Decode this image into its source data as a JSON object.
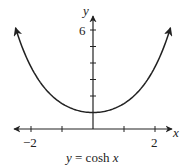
{
  "chart_data": {
    "type": "line",
    "title": "y = cosh x",
    "xlabel": "x",
    "ylabel": "y",
    "function": "cosh(x)",
    "xlim": [
      -2.5,
      2.5
    ],
    "ylim": [
      0,
      6.5
    ],
    "x_tick_labels": [
      {
        "value": -2,
        "label": "−2"
      },
      {
        "value": 2,
        "label": "2"
      }
    ],
    "x_ticks": [
      -2,
      -1,
      0,
      1,
      2
    ],
    "y_tick_labels": [
      {
        "value": 6,
        "label": "6"
      }
    ],
    "y_ticks": [
      1,
      2,
      3,
      4,
      5,
      6
    ],
    "grid": false,
    "legend": null,
    "series": [
      {
        "name": "y = cosh x",
        "x": [
          -2.5,
          -2,
          -1.5,
          -1,
          -0.5,
          0,
          0.5,
          1,
          1.5,
          2,
          2.5
        ],
        "y": [
          6.13,
          3.76,
          2.35,
          1.54,
          1.13,
          1.0,
          1.13,
          1.54,
          2.35,
          3.76,
          6.13
        ]
      }
    ]
  },
  "labels": {
    "x_axis": "x",
    "y_axis": "y",
    "tick_neg2": "−2",
    "tick_2": "2",
    "tick_6": "6",
    "caption_prefix": "y",
    "caption_mid": " = cosh ",
    "caption_var": "x"
  }
}
